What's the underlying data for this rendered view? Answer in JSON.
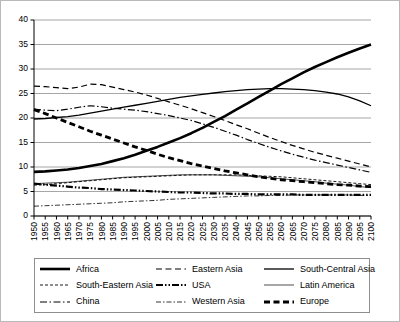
{
  "chart_data": {
    "type": "line",
    "title": "",
    "subtitle": "",
    "xlabel": "",
    "ylabel": "",
    "xlim": [
      1950,
      2100
    ],
    "ylim": [
      0,
      40
    ],
    "grid": true,
    "grid_axis": "y",
    "legend_position": "bottom",
    "legend_columns": 3,
    "yticks": [
      0,
      5,
      10,
      15,
      20,
      25,
      30,
      35,
      40
    ],
    "x": [
      1950,
      1955,
      1960,
      1965,
      1970,
      1975,
      1980,
      1985,
      1990,
      1995,
      2000,
      2005,
      2010,
      2015,
      2020,
      2025,
      2030,
      2035,
      2040,
      2045,
      2050,
      2055,
      2060,
      2065,
      2070,
      2075,
      2080,
      2085,
      2090,
      2095,
      2100
    ],
    "categories": [
      "1950",
      "1955",
      "1960",
      "1965",
      "1970",
      "1975",
      "1980",
      "1985",
      "1990",
      "1995",
      "2000",
      "2005",
      "2010",
      "2015",
      "2020",
      "2025",
      "2030",
      "2035",
      "2040",
      "2045",
      "2050",
      "2055",
      "2060",
      "2065",
      "2070",
      "2075",
      "2080",
      "2085",
      "2090",
      "2095",
      "2100"
    ],
    "series": [
      {
        "name": "Africa",
        "style": "thick-solid",
        "values": [
          9.0,
          9.1,
          9.3,
          9.5,
          9.8,
          10.2,
          10.6,
          11.2,
          11.8,
          12.5,
          13.3,
          14.1,
          15.0,
          15.9,
          16.9,
          18.0,
          19.2,
          20.4,
          21.7,
          23.0,
          24.3,
          25.6,
          26.9,
          28.1,
          29.3,
          30.4,
          31.4,
          32.4,
          33.3,
          34.2,
          35.0
        ]
      },
      {
        "name": "Eastern Asia",
        "style": "dashed",
        "values": [
          26.5,
          26.4,
          26.2,
          26.0,
          26.3,
          26.9,
          26.8,
          26.3,
          25.8,
          25.3,
          24.7,
          24.0,
          23.3,
          22.6,
          21.9,
          21.1,
          20.3,
          19.5,
          18.6,
          17.8,
          16.9,
          16.0,
          15.2,
          14.4,
          13.7,
          13.0,
          12.4,
          11.8,
          11.2,
          10.6,
          10.0
        ]
      },
      {
        "name": "South-Central Asia",
        "style": "medium-solid",
        "values": [
          19.8,
          19.9,
          20.1,
          20.3,
          20.6,
          21.0,
          21.4,
          21.8,
          22.2,
          22.6,
          23.0,
          23.4,
          23.8,
          24.2,
          24.5,
          24.8,
          25.1,
          25.4,
          25.6,
          25.8,
          25.9,
          26.0,
          26.0,
          25.9,
          25.8,
          25.6,
          25.3,
          24.9,
          24.3,
          23.5,
          22.5
        ]
      },
      {
        "name": "South-Eastern Asia",
        "style": "fine-dotted",
        "values": [
          6.3,
          6.4,
          6.6,
          6.8,
          7.0,
          7.2,
          7.4,
          7.6,
          7.8,
          7.9,
          8.0,
          8.1,
          8.2,
          8.3,
          8.4,
          8.4,
          8.4,
          8.4,
          8.4,
          8.3,
          8.2,
          8.1,
          8.0,
          7.8,
          7.6,
          7.4,
          7.2,
          7.0,
          6.8,
          6.6,
          6.4
        ]
      },
      {
        "name": "USA",
        "style": "thick-dashdotdot",
        "values": [
          6.6,
          6.4,
          6.2,
          6.0,
          5.8,
          5.7,
          5.5,
          5.4,
          5.3,
          5.2,
          5.1,
          5.0,
          4.9,
          4.8,
          4.8,
          4.7,
          4.6,
          4.6,
          4.5,
          4.5,
          4.4,
          4.4,
          4.4,
          4.4,
          4.3,
          4.3,
          4.3,
          4.3,
          4.3,
          4.3,
          4.3
        ]
      },
      {
        "name": "Latin America",
        "style": "thin-solid",
        "values": [
          6.6,
          6.7,
          6.8,
          6.9,
          7.1,
          7.3,
          7.5,
          7.7,
          7.9,
          8.0,
          8.1,
          8.2,
          8.3,
          8.4,
          8.4,
          8.4,
          8.4,
          8.3,
          8.2,
          8.1,
          8.0,
          7.8,
          7.6,
          7.4,
          7.2,
          7.0,
          6.7,
          6.5,
          6.3,
          6.0,
          5.8
        ]
      },
      {
        "name": "China",
        "style": "dashdot",
        "values": [
          21.8,
          21.6,
          21.5,
          21.8,
          22.2,
          22.5,
          22.3,
          22.0,
          21.8,
          21.6,
          21.3,
          20.9,
          20.5,
          20.0,
          19.5,
          18.8,
          18.1,
          17.3,
          16.5,
          15.6,
          14.8,
          14.0,
          13.3,
          12.6,
          12.0,
          11.4,
          10.9,
          10.4,
          9.9,
          9.4,
          8.9
        ]
      },
      {
        "name": "Western Asia",
        "style": "fine-dashdot",
        "values": [
          2.0,
          2.1,
          2.2,
          2.3,
          2.4,
          2.5,
          2.6,
          2.7,
          2.9,
          3.0,
          3.1,
          3.2,
          3.4,
          3.5,
          3.6,
          3.7,
          3.8,
          3.9,
          4.0,
          4.1,
          4.1,
          4.2,
          4.2,
          4.3,
          4.3,
          4.3,
          4.3,
          4.3,
          4.3,
          4.2,
          4.2
        ]
      },
      {
        "name": "Europe",
        "style": "thick-dashed",
        "values": [
          21.7,
          20.9,
          20.0,
          19.1,
          18.2,
          17.3,
          16.5,
          15.7,
          14.9,
          14.1,
          13.4,
          12.6,
          11.9,
          11.3,
          10.7,
          10.2,
          9.7,
          9.2,
          8.8,
          8.4,
          8.0,
          7.7,
          7.4,
          7.2,
          7.0,
          6.8,
          6.6,
          6.4,
          6.3,
          6.1,
          6.0
        ]
      }
    ]
  },
  "legend": {
    "items": [
      {
        "label": "Africa",
        "style": "thick-solid"
      },
      {
        "label": "Eastern Asia",
        "style": "dashed"
      },
      {
        "label": "South-Central Asia",
        "style": "medium-solid"
      },
      {
        "label": "South-Eastern Asia",
        "style": "fine-dotted"
      },
      {
        "label": "USA",
        "style": "thick-dashdotdot"
      },
      {
        "label": "Latin America",
        "style": "thin-solid"
      },
      {
        "label": "China",
        "style": "dashdot"
      },
      {
        "label": "Western Asia",
        "style": "fine-dashdot"
      },
      {
        "label": "Europe",
        "style": "thick-dashed"
      }
    ]
  },
  "colors": {
    "line": "#000000",
    "grid": "#808080",
    "axis": "#000000",
    "background": "#ffffff",
    "border": "#b9b9b9"
  }
}
